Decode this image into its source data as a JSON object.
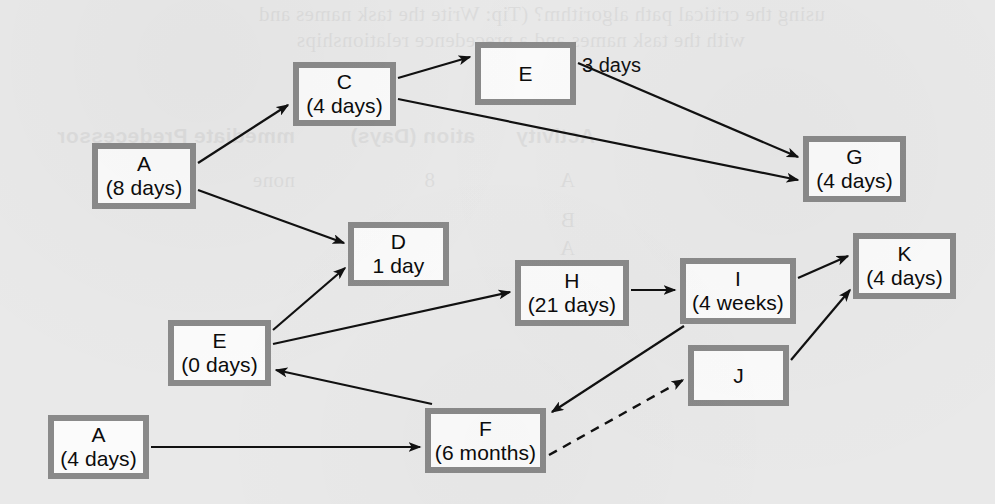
{
  "diagram": {
    "background_color": "#e9e9e9",
    "node_fill_color": "#fbfbfb",
    "node_border_color": "#8a8a8a",
    "edge_color": "#111111",
    "nodes": [
      {
        "key": "a8",
        "id": "A",
        "duration": "(8 days)",
        "x": 92,
        "y": 143,
        "w": 104,
        "h": 66
      },
      {
        "key": "c4",
        "id": "C",
        "duration": "(4 days)",
        "x": 293,
        "y": 62,
        "w": 103,
        "h": 64
      },
      {
        "key": "etop",
        "id": "E",
        "duration": "",
        "x": 475,
        "y": 42,
        "w": 101,
        "h": 63
      },
      {
        "key": "g4",
        "id": "G",
        "duration": "(4 days)",
        "x": 803,
        "y": 136,
        "w": 103,
        "h": 66
      },
      {
        "key": "d1",
        "id": "D",
        "duration": "1 day",
        "x": 348,
        "y": 222,
        "w": 101,
        "h": 64
      },
      {
        "key": "e0",
        "id": "E",
        "duration": "(0 days)",
        "x": 168,
        "y": 320,
        "w": 103,
        "h": 66
      },
      {
        "key": "h21",
        "id": "H",
        "duration": "(21 days)",
        "x": 515,
        "y": 260,
        "w": 114,
        "h": 66
      },
      {
        "key": "i4w",
        "id": "I",
        "duration": "(4 weeks)",
        "x": 680,
        "y": 258,
        "w": 116,
        "h": 66
      },
      {
        "key": "k4",
        "id": "K",
        "duration": "(4 days)",
        "x": 853,
        "y": 233,
        "w": 103,
        "h": 66
      },
      {
        "key": "j",
        "id": "J",
        "duration": "",
        "x": 688,
        "y": 345,
        "w": 101,
        "h": 61
      },
      {
        "key": "f6",
        "id": "F",
        "duration": "(6 months)",
        "x": 425,
        "y": 408,
        "w": 121,
        "h": 65
      },
      {
        "key": "a4",
        "id": "A",
        "duration": "(4 days)",
        "x": 48,
        "y": 415,
        "w": 101,
        "h": 64
      }
    ],
    "edges": [
      {
        "from": "A (8 days)",
        "to": "C (4 days)",
        "style": "solid",
        "x1": 198,
        "y1": 163,
        "x2": 288,
        "y2": 105
      },
      {
        "from": "A (8 days)",
        "to": "D 1 day",
        "style": "solid",
        "x1": 198,
        "y1": 190,
        "x2": 344,
        "y2": 243
      },
      {
        "from": "C (4 days)",
        "to": "E",
        "style": "solid",
        "x1": 398,
        "y1": 78,
        "x2": 470,
        "y2": 57
      },
      {
        "from": "C (4 days)",
        "to": "G (4 days)",
        "style": "solid",
        "x1": 398,
        "y1": 99,
        "x2": 798,
        "y2": 180
      },
      {
        "from": "E",
        "to": "G (4 days)",
        "style": "solid",
        "x1": 578,
        "y1": 63,
        "x2": 798,
        "y2": 157
      },
      {
        "from": "E (0 days)",
        "to": "D 1 day",
        "style": "solid",
        "x1": 273,
        "y1": 330,
        "x2": 345,
        "y2": 268
      },
      {
        "from": "E (0 days)",
        "to": "H (21 days)",
        "style": "solid",
        "x1": 273,
        "y1": 344,
        "x2": 510,
        "y2": 292
      },
      {
        "from": "F (6 months)",
        "to": "E (0 days)",
        "style": "solid",
        "x1": 432,
        "y1": 404,
        "x2": 276,
        "y2": 370
      },
      {
        "from": "A (4 days)",
        "to": "F (6 months)",
        "style": "solid",
        "x1": 151,
        "y1": 447,
        "x2": 420,
        "y2": 447
      },
      {
        "from": "H (21 days)",
        "to": "I (4 weeks)",
        "style": "solid",
        "x1": 631,
        "y1": 290,
        "x2": 675,
        "y2": 290
      },
      {
        "from": "I (4 weeks)",
        "to": "F (6 months)",
        "style": "solid",
        "x1": 684,
        "y1": 326,
        "x2": 552,
        "y2": 412
      },
      {
        "from": "I (4 weeks)",
        "to": "K (4 days)",
        "style": "solid",
        "x1": 798,
        "y1": 278,
        "x2": 848,
        "y2": 256
      },
      {
        "from": "J",
        "to": "K (4 days)",
        "style": "solid",
        "x1": 791,
        "y1": 360,
        "x2": 850,
        "y2": 290
      },
      {
        "from": "F (6 months)",
        "to": "J",
        "style": "dashed",
        "x1": 549,
        "y1": 455,
        "x2": 683,
        "y2": 380
      }
    ],
    "edge_labels": [
      {
        "text": "3 days",
        "x": 582,
        "y": 54
      }
    ],
    "bleed_text": [
      {
        "text": "using the critical path algorithm? (Tip: Write the task names and",
        "x": 170,
        "y": 2,
        "bold": false
      },
      {
        "text": "with the task names and a precedence relationships",
        "x": 250,
        "y": 28,
        "bold": false
      },
      {
        "text": "Activity",
        "x": 400,
        "y": 124,
        "bold": true
      },
      {
        "text": "ation (Days)",
        "x": 520,
        "y": 124,
        "bold": true
      },
      {
        "text": "mmediate Predecessor",
        "x": 700,
        "y": 124,
        "bold": true
      },
      {
        "text": "A",
        "x": 420,
        "y": 168,
        "bold": false
      },
      {
        "text": "8",
        "x": 560,
        "y": 168,
        "bold": false
      },
      {
        "text": "none",
        "x": 700,
        "y": 168,
        "bold": false
      },
      {
        "text": "B",
        "x": 420,
        "y": 208,
        "bold": false
      },
      {
        "text": "A",
        "x": 420,
        "y": 236,
        "bold": false
      },
      {
        "text": "none",
        "x": 560,
        "y": 248,
        "bold": false
      }
    ]
  }
}
